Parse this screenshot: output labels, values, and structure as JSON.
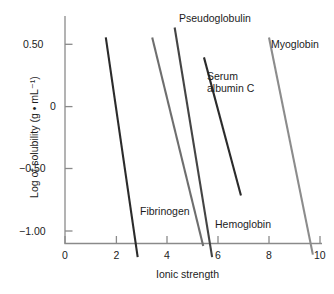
{
  "chart_data": {
    "type": "line",
    "title": "",
    "xlabel": "Ionic strength",
    "ylabel": "Log of solubility (g • mL⁻¹)",
    "xlim": [
      0,
      10.4
    ],
    "ylim": [
      -1.21,
      0.64
    ],
    "xticks": [
      0,
      2,
      4,
      6,
      8,
      10
    ],
    "xticklabels": [
      "0",
      "2",
      "4",
      "6",
      "8",
      "10"
    ],
    "yticks": [
      0.5,
      0,
      -0.5,
      -1.0
    ],
    "yticklabels": [
      "0.50",
      "0",
      "−0.50",
      "−1.00"
    ],
    "grid": false,
    "legend": "inline-annotations",
    "series": [
      {
        "name": "Fibrinogen",
        "color": "#2b2b2b",
        "x": [
          1.6,
          2.85
        ],
        "y": [
          0.555,
          -1.21
        ],
        "label": "Fibrinogen",
        "label_x": 2.12,
        "label_y": -0.99
      },
      {
        "name": "Pseudoglobulin",
        "color": "#444444",
        "x": [
          4.3,
          5.77
        ],
        "y": [
          0.635,
          -1.21
        ],
        "label": "Pseudoglobulin",
        "label_x": 4.42,
        "label_y": 0.625
      },
      {
        "name": "Serum albumin C",
        "color": "#2b2b2b",
        "x": [
          5.45,
          6.9
        ],
        "y": [
          0.395,
          -0.715
        ],
        "label": "Serum\nalbumin C",
        "label_x": 6.02,
        "label_y": 0.205
      },
      {
        "name": "Hemoglobin",
        "color": "#6e6e6e",
        "x": [
          3.42,
          5.42
        ],
        "y": [
          0.555,
          -1.12
        ],
        "label": "Hemoglobin",
        "label_x": 6.0,
        "label_y": -1.045
      },
      {
        "name": "Myoglobin",
        "color": "#8c8c8c",
        "x": [
          8.0,
          9.72
        ],
        "y": [
          0.555,
          -1.19
        ],
        "label": "Myoglobin",
        "label_x": 8.45,
        "label_y": 0.465
      }
    ],
    "axis_color": "#8a8a8a",
    "caption": ""
  },
  "labels": {
    "fibrinogen": "Fibrinogen",
    "pseudoglobulin": "Pseudoglobulin",
    "serum_albumin_line1": "Serum",
    "serum_albumin_line2": "albumin C",
    "hemoglobin": "Hemoglobin",
    "myoglobin": "Myoglobin"
  },
  "axes": {
    "x_title": "Ionic strength",
    "y_title": "Log of solubility (g • mL⁻¹)",
    "x_tick_0": "0",
    "x_tick_2": "2",
    "x_tick_4": "4",
    "x_tick_6": "6",
    "x_tick_8": "8",
    "x_tick_10": "10",
    "y_tick_050": "0.50",
    "y_tick_0": "0",
    "y_tick_neg050": "−0.50",
    "y_tick_neg100": "−1.00"
  }
}
